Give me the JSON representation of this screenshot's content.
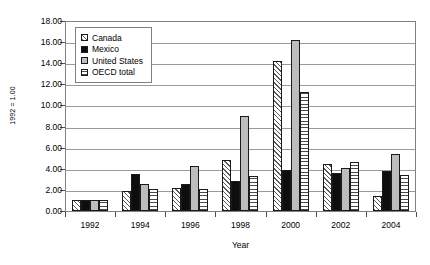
{
  "chart_data": {
    "type": "bar",
    "title": "",
    "xlabel": "Year",
    "ylabel": "1992 = 1.00",
    "categories": [
      "1992",
      "1994",
      "1996",
      "1998",
      "2000",
      "2002",
      "2004"
    ],
    "ylim": [
      0.0,
      18.0
    ],
    "ytick_step": 2.0,
    "ytick_labels": [
      "0.00",
      "2.00",
      "4.00",
      "6.00",
      "8.00",
      "10.00",
      "12.00",
      "14.00",
      "16.00",
      "18.00"
    ],
    "grid": true,
    "legend_position": "upper-left-inside",
    "series": [
      {
        "name": "Canada",
        "pattern": "diagonal-hatch",
        "color": "#ffffff",
        "values": [
          1.0,
          1.9,
          2.2,
          4.8,
          14.2,
          4.5,
          1.4
        ]
      },
      {
        "name": "Mexico",
        "pattern": "solid-black",
        "color": "#0d0d0d",
        "values": [
          1.0,
          3.5,
          2.6,
          2.8,
          3.9,
          3.6,
          3.8
        ]
      },
      {
        "name": "United States",
        "pattern": "solid-gray",
        "color": "#bdbdbd",
        "values": [
          1.0,
          2.6,
          4.3,
          9.0,
          16.2,
          4.1,
          5.4
        ]
      },
      {
        "name": "OECD total",
        "pattern": "horizontal-hatch",
        "color": "#ffffff",
        "values": [
          1.0,
          2.1,
          2.1,
          3.3,
          11.3,
          4.6,
          3.4
        ]
      }
    ]
  },
  "axis": {
    "ylabel_text": "1992 = 1.00",
    "xtitle_text": "Year"
  }
}
